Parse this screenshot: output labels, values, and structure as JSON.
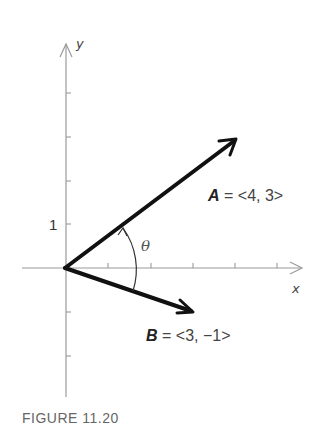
{
  "figure": {
    "caption": "FIGURE 11.20",
    "axes": {
      "x_label": "x",
      "y_label": "y",
      "y_tick_label": "1"
    },
    "vectors": [
      {
        "name": "A",
        "equals": "=",
        "components": "<4, 3>",
        "x": 4,
        "y": 3
      },
      {
        "name": "B",
        "equals": "=",
        "components": "<3, −1>",
        "x": 3,
        "y": -1
      }
    ],
    "angle_label": "θ",
    "colors": {
      "axis": "#9a9a9a",
      "vector": "#111111",
      "text": "#444444",
      "caption": "#666666"
    }
  }
}
